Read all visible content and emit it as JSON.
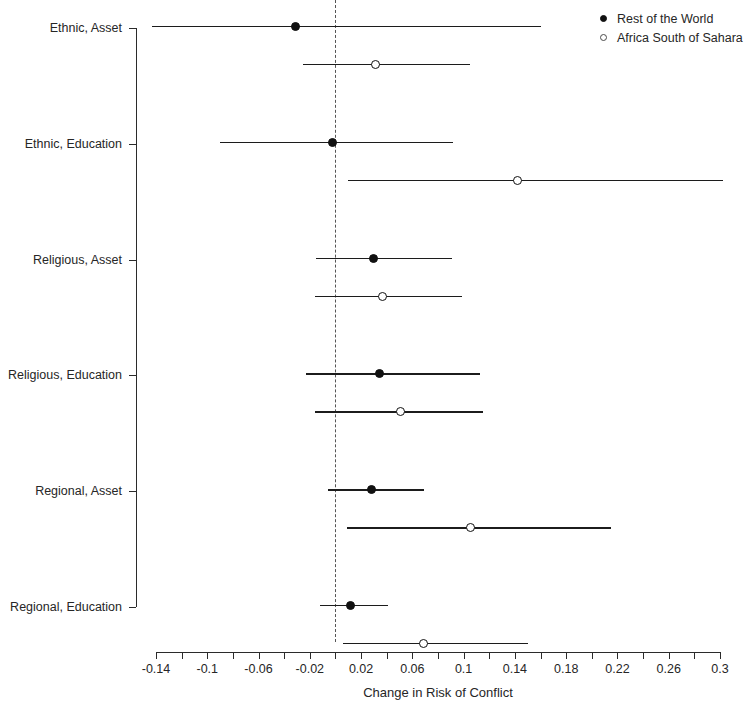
{
  "chart_data": {
    "type": "scatter",
    "title": "",
    "xlabel": "Change in Risk of Conflict",
    "ylabel": "",
    "xlim": [
      -0.14,
      0.3
    ],
    "grid": false,
    "legend_position": "top-right",
    "x_ticks": [
      {
        "value": -0.14,
        "label": "-0.14"
      },
      {
        "value": -0.12,
        "label": ""
      },
      {
        "value": -0.1,
        "label": "-0.1"
      },
      {
        "value": -0.08,
        "label": ""
      },
      {
        "value": -0.06,
        "label": "-0.06"
      },
      {
        "value": -0.04,
        "label": ""
      },
      {
        "value": -0.02,
        "label": "-0.02"
      },
      {
        "value": 0.0,
        "label": ""
      },
      {
        "value": 0.02,
        "label": "0.02"
      },
      {
        "value": 0.04,
        "label": ""
      },
      {
        "value": 0.06,
        "label": "0.06"
      },
      {
        "value": 0.08,
        "label": ""
      },
      {
        "value": 0.1,
        "label": "0.1"
      },
      {
        "value": 0.12,
        "label": ""
      },
      {
        "value": 0.14,
        "label": "0.14"
      },
      {
        "value": 0.16,
        "label": ""
      },
      {
        "value": 0.18,
        "label": "0.18"
      },
      {
        "value": 0.2,
        "label": ""
      },
      {
        "value": 0.22,
        "label": "0.22"
      },
      {
        "value": 0.24,
        "label": ""
      },
      {
        "value": 0.26,
        "label": "0.26"
      },
      {
        "value": 0.28,
        "label": ""
      },
      {
        "value": 0.3,
        "label": "0.3"
      }
    ],
    "categories": [
      "Ethnic, Asset",
      "Ethnic, Education",
      "Religious, Asset",
      "Religious, Education",
      "Regional, Asset",
      "Regional, Education"
    ],
    "reference_line": {
      "value": 0.0,
      "style": "dashed"
    },
    "series": [
      {
        "name": "Rest of the World",
        "marker": "filled-circle",
        "color": "#111111",
        "points": [
          {
            "category": "Ethnic, Asset",
            "estimate": -0.031,
            "ci_low": -0.143,
            "ci_high": 0.16
          },
          {
            "category": "Ethnic, Education",
            "estimate": -0.002,
            "ci_low": -0.09,
            "ci_high": 0.092
          },
          {
            "category": "Religious, Asset",
            "estimate": 0.03,
            "ci_low": -0.015,
            "ci_high": 0.091
          },
          {
            "category": "Religious, Education",
            "estimate": 0.034,
            "ci_low": -0.023,
            "ci_high": 0.113
          },
          {
            "category": "Regional, Asset",
            "estimate": 0.028,
            "ci_low": -0.006,
            "ci_high": 0.069
          },
          {
            "category": "Regional, Education",
            "estimate": 0.012,
            "ci_low": -0.012,
            "ci_high": 0.041
          }
        ]
      },
      {
        "name": "Africa South of Sahara",
        "marker": "open-circle",
        "color": "#111111",
        "points": [
          {
            "category": "Ethnic, Asset",
            "estimate": 0.031,
            "ci_low": -0.025,
            "ci_high": 0.105
          },
          {
            "category": "Ethnic, Education",
            "estimate": 0.142,
            "ci_low": 0.01,
            "ci_high": 0.302
          },
          {
            "category": "Religious, Asset",
            "estimate": 0.037,
            "ci_low": -0.016,
            "ci_high": 0.099
          },
          {
            "category": "Religious, Education",
            "estimate": 0.051,
            "ci_low": -0.016,
            "ci_high": 0.115
          },
          {
            "category": "Regional, Asset",
            "estimate": 0.105,
            "ci_low": 0.009,
            "ci_high": 0.215
          },
          {
            "category": "Regional, Education",
            "estimate": 0.069,
            "ci_low": 0.006,
            "ci_high": 0.15
          }
        ]
      }
    ]
  },
  "legend": {
    "entries": [
      {
        "label": "Rest of the World",
        "marker": "filled-circle"
      },
      {
        "label": "Africa South of Sahara",
        "marker": "open-circle"
      }
    ]
  }
}
